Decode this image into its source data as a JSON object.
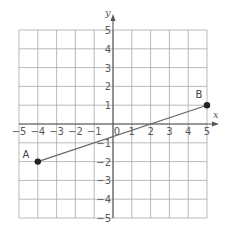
{
  "chart_data": {
    "type": "line",
    "title": "",
    "xlabel": "x",
    "ylabel": "y",
    "xlim": [
      -5,
      5
    ],
    "ylim": [
      -5,
      5
    ],
    "grid": true,
    "x_ticks": [
      "-5",
      "-4",
      "-3",
      "-2",
      "-1",
      "0",
      "1",
      "2",
      "3",
      "4",
      "5"
    ],
    "y_ticks": [
      "5",
      "4",
      "3",
      "2",
      "1",
      "-1",
      "-2",
      "-3",
      "-4",
      "-5"
    ],
    "series": [
      {
        "name": "segment AB",
        "points": [
          {
            "label": "A",
            "x": -4,
            "y": -2
          },
          {
            "label": "B",
            "x": 5,
            "y": 1
          }
        ]
      }
    ]
  },
  "colors": {
    "grid": "#a8a8a8",
    "axis": "#555555",
    "segment": "#666666",
    "point": "#222222"
  }
}
